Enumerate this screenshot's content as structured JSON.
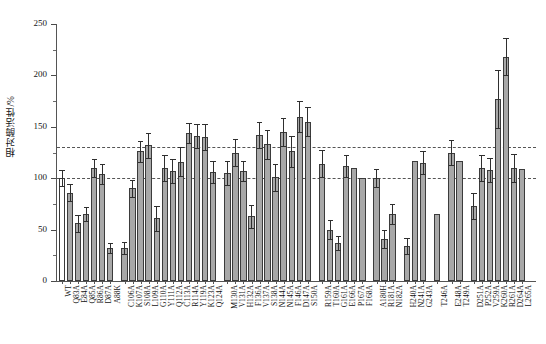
{
  "chart_data": {
    "type": "bar",
    "title": "",
    "xlabel": "",
    "ylabel": "相对酶活性/%",
    "ylim": [
      0,
      250
    ],
    "ytick_labels": [
      "0",
      "50",
      "100",
      "150",
      "200",
      "250"
    ],
    "ytick_values": [
      0,
      50,
      100,
      150,
      200,
      250
    ],
    "yminor_values": [
      25,
      75,
      125,
      175,
      225
    ],
    "grid": false,
    "legend": "none",
    "reference_lines": [
      {
        "value": 130,
        "style": "dashed",
        "color": "#555555"
      },
      {
        "value": 100,
        "style": "dashed",
        "color": "#555555"
      }
    ],
    "error_bar_type": "standard deviation",
    "bar_fill_color": "#a8a8a8",
    "bar_edge_color": "#3b3b3b",
    "categories": [
      "WT",
      "Q83A",
      "E84A",
      "Q85A",
      "R86A",
      "D87A",
      "A88K",
      "C106A",
      "K107A",
      "S108A",
      "L109A",
      "G110A",
      "Y111A",
      "Q112A",
      "C113A",
      "R114A",
      "Y119A",
      "K123A",
      "Q124A",
      "M130A",
      "V131A",
      "H132A",
      "F136A",
      "V137A",
      "S138A",
      "N144A",
      "N145A",
      "F146A",
      "D147A",
      "S150A",
      "R159A",
      "T160A",
      "G161A",
      "E166A",
      "P167A",
      "F168A",
      "A180H",
      "R181A",
      "N182A",
      "H240A",
      "N241A",
      "G243A",
      "T246A",
      "E248A",
      "T249A",
      "D251A",
      "P252A",
      "V259A",
      "K260A",
      "R261A",
      "D264A",
      "L265A"
    ],
    "values": [
      100,
      86,
      56,
      65,
      110,
      104,
      32,
      32,
      90,
      126,
      132,
      61,
      110,
      107,
      116,
      144,
      141,
      140,
      106,
      105,
      125,
      107,
      63,
      142,
      133,
      101,
      145,
      126,
      160,
      155,
      114,
      50,
      37,
      112,
      110,
      100,
      100,
      41,
      65,
      34,
      117,
      115,
      65,
      125,
      117,
      73,
      110,
      108,
      177,
      218,
      110,
      109
    ],
    "errors": [
      8,
      8,
      8,
      7,
      9,
      10,
      5,
      6,
      8,
      10,
      12,
      12,
      13,
      12,
      14,
      10,
      12,
      13,
      11,
      12,
      13,
      10,
      11,
      13,
      14,
      13,
      14,
      15,
      15,
      14,
      13,
      9,
      7,
      11,
      0,
      0,
      9,
      9,
      10,
      8,
      0,
      11,
      0,
      12,
      0,
      13,
      13,
      12,
      28,
      18,
      14,
      0
    ],
    "gaps_after": [
      "A88K",
      "Q124A",
      "S150A",
      "F168A",
      "N182A",
      "G243A",
      "T246A",
      "T249A"
    ]
  }
}
